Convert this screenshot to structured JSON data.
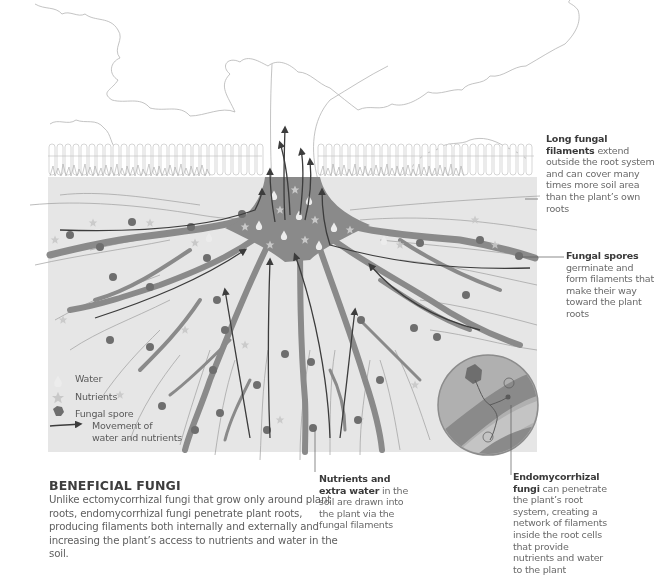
{
  "colors": {
    "soil": "#e6e6e6",
    "root": "#8a8a8a",
    "arrow": "#3c3c3c",
    "spore": "#6e6e6e",
    "nutrient": "#c8c8c8",
    "water": "#ececec",
    "line_art": "#b4b4b4",
    "inset_bg": "#b0b0b0"
  },
  "callouts": {
    "long_filaments": {
      "bold": "Long fungal filaments",
      "text": " extend outside the root system and can cover many times more soil area than the plant’s own roots"
    },
    "spores": {
      "bold": "Fungal spores",
      "text": " germinate and form filaments that make their way toward the plant roots"
    },
    "nutrients": {
      "bold": "Nutrients and extra water",
      "text": " in the soil are drawn into the plant via the fungal filaments"
    },
    "endo": {
      "bold": "Endomycorrhizal fungi",
      "text": " can penetrate the plant’s root system, creating a network of filaments inside the root cells that provide nutrients and water to the plant"
    }
  },
  "legend": {
    "water": {
      "label": "Water",
      "icon": "water-drop-icon"
    },
    "nutrients": {
      "label": "Nutrients",
      "icon": "star-icon"
    },
    "spore": {
      "label": "Fungal spore",
      "icon": "hexagon-icon"
    },
    "movement": {
      "label_line1": "Movement of",
      "label_line2": "water and nutrients",
      "icon": "arrow-icon"
    }
  },
  "intro": {
    "title": "BENEFICIAL FUNGI",
    "body": "Unlike ectomycorrhizal fungi that grow only around plant roots, endomycorrhizal fungi penetrate plant roots, producing filaments both internally and externally and increasing the plant’s access to nutrients and water in the soil."
  }
}
